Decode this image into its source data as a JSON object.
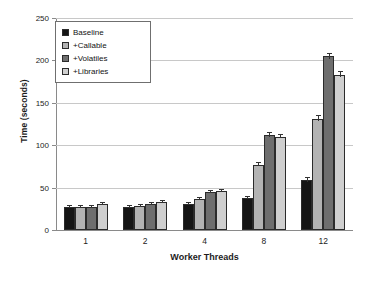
{
  "chart_data": {
    "type": "bar",
    "title": "",
    "xlabel": "Worker Threads",
    "ylabel": "Time (seconds)",
    "categories": [
      "1",
      "2",
      "4",
      "8",
      "12"
    ],
    "ylim": [
      0,
      250
    ],
    "yticks": [
      0,
      50,
      100,
      150,
      200,
      250
    ],
    "grid": "horizontal",
    "legend_position": "upper-left-inside",
    "series": [
      {
        "name": "Baseline",
        "color": "#151515",
        "values": [
          27,
          27,
          31,
          38,
          59
        ]
      },
      {
        "name": "+Callable",
        "color": "#b3b3b3",
        "values": [
          27,
          28,
          37,
          77,
          131
        ]
      },
      {
        "name": "+Volatiles",
        "color": "#6e6e6e",
        "values": [
          27,
          31,
          45,
          112,
          205
        ]
      },
      {
        "name": "+Libraries",
        "color": "#cfcfcf",
        "values": [
          31,
          33,
          46,
          110,
          183
        ]
      }
    ],
    "errors": [
      [
        1,
        1,
        1,
        1,
        2
      ],
      [
        1,
        1,
        1,
        2,
        3
      ],
      [
        1,
        1,
        1,
        2,
        3
      ],
      [
        1,
        1,
        1,
        2,
        3
      ]
    ]
  },
  "axis": {
    "ytick_labels": [
      "250",
      "200",
      "150",
      "100",
      "50",
      "0"
    ],
    "xtick_labels": [
      "1",
      "2",
      "4",
      "8",
      "12"
    ]
  },
  "legend": {
    "items": [
      {
        "label": "Baseline"
      },
      {
        "label": "+Callable"
      },
      {
        "label": "+Volatiles"
      },
      {
        "label": "+Libraries"
      }
    ]
  }
}
